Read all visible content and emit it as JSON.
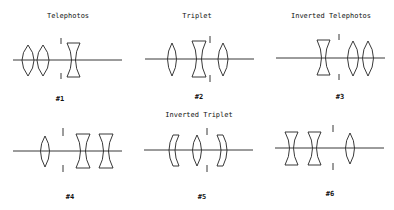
{
  "panels": [
    {
      "title": "Telephotos",
      "label": "#1",
      "elements": [
        "biconvex",
        "biconvex",
        "stop",
        "biconcave"
      ]
    },
    {
      "title": "Triplet",
      "label": "#2",
      "elements": [
        "biconvex",
        "biconcave",
        "stop",
        "biconvex"
      ]
    },
    {
      "title": "Inverted Telephotos",
      "label": "#3",
      "elements": [
        "biconcave",
        "stop",
        "biconvex",
        "biconvex"
      ]
    },
    {
      "title": "",
      "label": "#4",
      "elements": [
        "biconvex",
        "stop",
        "biconcave",
        "biconcave"
      ]
    },
    {
      "title": "Inverted Triplet",
      "label": "#5",
      "elements": [
        "meniscus-left",
        "biconvex",
        "stop",
        "meniscus-right"
      ]
    },
    {
      "title": "",
      "label": "#6",
      "elements": [
        "biconcave",
        "biconcave",
        "stop",
        "biconvex"
      ]
    }
  ],
  "colors": {
    "line": "#222222",
    "background": "#ffffff"
  }
}
